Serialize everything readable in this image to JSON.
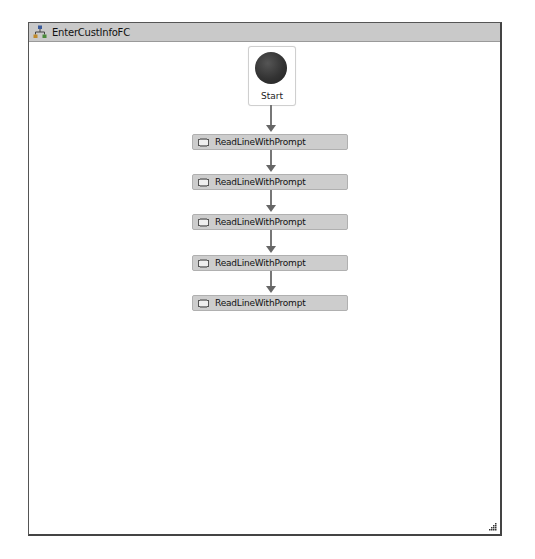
{
  "designer": {
    "title": "EnterCustInfoFC",
    "title_icon": "flowchart-icon"
  },
  "start_node": {
    "label": "Start"
  },
  "activities": [
    {
      "label": "ReadLineWithPrompt",
      "icon": "activity-icon"
    },
    {
      "label": "ReadLineWithPrompt",
      "icon": "activity-icon"
    },
    {
      "label": "ReadLineWithPrompt",
      "icon": "activity-icon"
    },
    {
      "label": "ReadLineWithPrompt",
      "icon": "activity-icon"
    },
    {
      "label": "ReadLineWithPrompt",
      "icon": "activity-icon"
    }
  ],
  "colors": {
    "titlebar": "#c9c9c9",
    "activity_fill": "#cdcdcd",
    "connector": "#777777",
    "start_circle": "#333333"
  }
}
